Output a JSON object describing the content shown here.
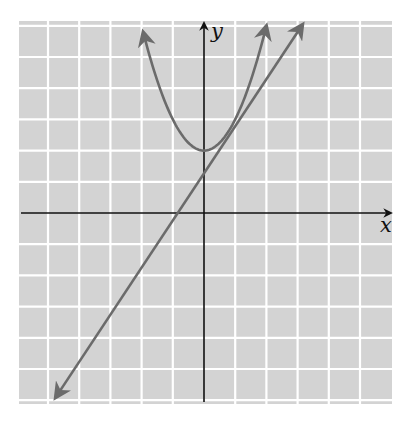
{
  "chart_data": {
    "type": "line",
    "title": "",
    "xlabel": "x",
    "ylabel": "y",
    "xlim": [
      -6,
      6
    ],
    "ylim": [
      -6,
      6
    ],
    "grid": true,
    "tick_labels": false,
    "legend": null,
    "series": [
      {
        "name": "parabola",
        "equation": "y = x^2 + 2",
        "kind": "curve",
        "x_range": [
          -1.95,
          2.0
        ],
        "vertex": [
          0,
          2
        ],
        "arrows": "both"
      },
      {
        "name": "line",
        "equation": "y ≈ 1.5x + 1.27",
        "kind": "line",
        "slope": 1.51,
        "intercept": 1.27,
        "x_range": [
          -4.76,
          3.16
        ],
        "x_intercept": -0.85,
        "arrows": "both"
      }
    ]
  },
  "labels": {
    "x_axis": "x",
    "y_axis": "y"
  },
  "style": {
    "grid_bg": "#d3d3d3",
    "grid_line": "#ffffff",
    "curve_color": "#6b6b6b",
    "axis_color": "#111111"
  },
  "layout": {
    "origin_px": [
      204,
      213
    ],
    "unit_px": 31.2,
    "grid_box_px": [
      19,
      21,
      392,
      404
    ]
  }
}
